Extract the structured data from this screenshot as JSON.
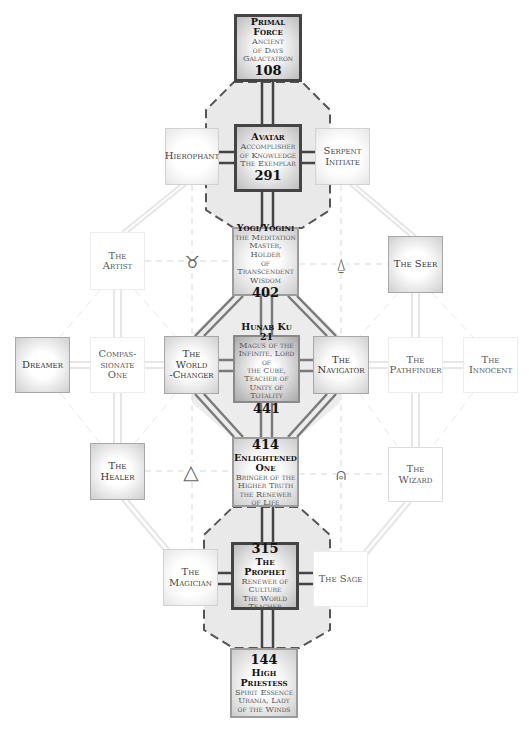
{
  "diagram": {
    "primal_force": {
      "title": "Primal Force",
      "sub1": "Ancient",
      "sub2": "of Days",
      "sub3": "Galactatron",
      "number": "108"
    },
    "avatar": {
      "title": "Avatar",
      "sub1": "Accomplisher",
      "sub2": "of Knowledge",
      "sub3": "The Exemplar",
      "number": "291"
    },
    "hierophant": {
      "label": "Hierophant"
    },
    "serpent_initiate": {
      "line1": "Serpent",
      "line2": "Initiate"
    },
    "artist": {
      "line1": "The",
      "line2": "Artist"
    },
    "yogi": {
      "title": "Yogi/Yogini",
      "sub1": "the Meditation",
      "sub2": "Master, Holder",
      "sub3": "of Transcendent",
      "sub4": "Wisdom",
      "number": "402"
    },
    "seer": {
      "label": "The Seer"
    },
    "dreamer": {
      "label": "Dreamer"
    },
    "compassionate": {
      "line1": "Compas-",
      "line2": "sionate",
      "line3": "One"
    },
    "world_changer": {
      "line1": "The",
      "line2": "World",
      "line3": "-Changer"
    },
    "hunab_ku": {
      "title": "Hunab Ku 21",
      "sub1": "Magus of the",
      "sub2": "Infinite, Lord of",
      "sub3": "the Cube,",
      "sub4": "Teacher of",
      "sub5": "Unity of Totality",
      "number": "441"
    },
    "navigator": {
      "line1": "The",
      "line2": "Navigator"
    },
    "pathfinder": {
      "line1": "The",
      "line2": "Pathfinder"
    },
    "innocent": {
      "line1": "The",
      "line2": "Innocent"
    },
    "healer": {
      "line1": "The",
      "line2": "Healer"
    },
    "enlightened": {
      "number": "414",
      "title1": "Enlightened",
      "title2": "One",
      "sub1": "Bringer of the",
      "sub2": "Higher Truth",
      "sub3": "the Renewer",
      "sub4": "of Life"
    },
    "wizard": {
      "line1": "The",
      "line2": "Wizard"
    },
    "magician": {
      "line1": "The",
      "line2": "Magician"
    },
    "prophet": {
      "number": "315",
      "title": "The Prophet",
      "sub1": "Renewer of",
      "sub2": "Culture",
      "sub3": "The World",
      "sub4": "Teacher"
    },
    "sage": {
      "label": "The Sage"
    },
    "high_priestess": {
      "number": "144",
      "title1": "High",
      "title2": "Priestess",
      "sub1": "Spirit Essence",
      "sub2": "Urania, Lady",
      "sub3": "of the Winds"
    },
    "symbols": {
      "taurus_left": "♉",
      "triangle_drop_right": "⍙",
      "triangle_left": "△",
      "triangle_circle_right": "⍝"
    }
  },
  "colors": {
    "dark_border": "#444444",
    "line_gray": "#7a7a7a",
    "faint_line": "#e4e4e4",
    "dashed_line": "#dddddd"
  }
}
